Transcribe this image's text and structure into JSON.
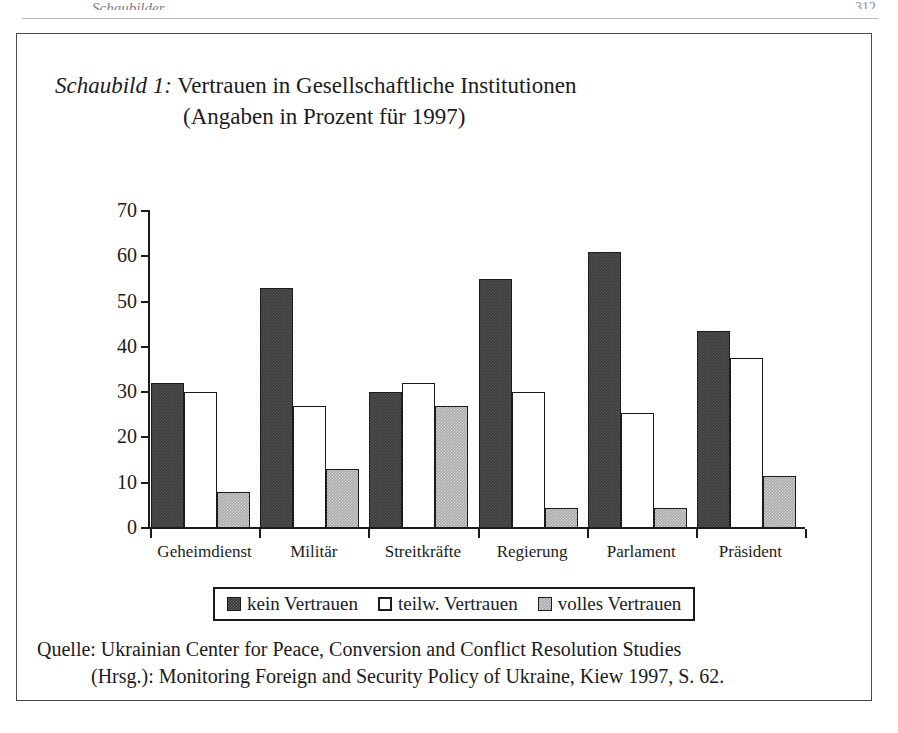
{
  "page": {
    "header_left_cropped": "Schaubilder",
    "header_right_cropped": "312"
  },
  "figure": {
    "caption_label": "Schaubild 1:",
    "caption_line1": "Vertrauen in Gesellschaftliche Institutionen",
    "caption_line2": "(Angaben in Prozent für 1997)",
    "source_line1": "Quelle: Ukrainian Center for Peace, Conversion and Conflict Resolution Studies",
    "source_line2": "(Hrsg.): Monitoring Foreign and Security Policy of Ukraine, Kiew 1997, S. 62."
  },
  "chart_data": {
    "type": "bar",
    "title": "Vertrauen in Gesellschaftliche Institutionen",
    "subtitle": "(Angaben in Prozent für 1997)",
    "xlabel": "",
    "ylabel": "",
    "ylim": [
      0,
      70
    ],
    "yticks": [
      0,
      10,
      20,
      30,
      40,
      50,
      60,
      70
    ],
    "ytick_labels": [
      "0",
      "10",
      "20",
      "30",
      "40",
      "50",
      "60",
      "70"
    ],
    "grid": false,
    "legend_position": "bottom",
    "categories": [
      "Geheimdienst",
      "Militär",
      "Streitkräfte",
      "Regierung",
      "Parlament",
      "Präsident"
    ],
    "series": [
      {
        "name": "kein Vertrauen",
        "color": "#3a3a3a",
        "values": [
          32,
          53,
          30,
          55,
          61,
          43.5
        ]
      },
      {
        "name": "teilw. Vertrauen",
        "color": "#ffffff",
        "values": [
          30,
          27,
          32,
          30,
          25.5,
          37.5
        ]
      },
      {
        "name": "volles Vertrauen",
        "color": "#a8a8a8",
        "values": [
          8,
          13,
          27,
          4.5,
          4.5,
          11.5
        ]
      }
    ]
  }
}
